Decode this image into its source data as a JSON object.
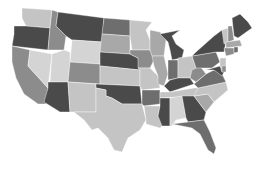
{
  "map": {
    "title": "",
    "shades": {
      "dark": "#4a4a4a",
      "mid_dark": "#6e6e6e",
      "mid": "#8c8c8c",
      "mid_light": "#a8a8a8",
      "light": "#c4c4c4",
      "lightest": "#d4d4d4"
    },
    "states": [
      {
        "id": "WA",
        "shade": "light",
        "points": "22,8 52,10 50,28 26,26 22,18"
      },
      {
        "id": "OR",
        "shade": "dark",
        "points": "14,26 26,26 50,28 48,50 12,46 14,34"
      },
      {
        "id": "CA",
        "shade": "mid",
        "points": "12,46 30,50 28,66 48,88 46,104 38,104 24,94 16,78 12,62"
      },
      {
        "id": "NV",
        "shade": "lightest",
        "points": "30,50 52,54 48,88 28,66"
      },
      {
        "id": "ID",
        "shade": "mid",
        "points": "52,10 58,12 56,26 66,36 64,50 48,50 50,28"
      },
      {
        "id": "MT",
        "shade": "dark",
        "points": "58,12 104,18 102,42 72,40 66,36 56,26"
      },
      {
        "id": "WY",
        "shade": "lightest",
        "points": "72,40 102,42 100,64 70,62"
      },
      {
        "id": "UT",
        "shade": "lightest",
        "points": "52,54 64,50 70,52 70,62 68,82 50,82"
      },
      {
        "id": "AZ",
        "shade": "dark",
        "points": "48,82 68,82 70,112 60,112 44,102 48,88"
      },
      {
        "id": "CO",
        "shade": "mid",
        "points": "70,62 100,64 100,84 68,82"
      },
      {
        "id": "NM",
        "shade": "light",
        "points": "68,82 96,84 96,112 74,112 70,112"
      },
      {
        "id": "ND",
        "shade": "mid_dark",
        "points": "104,18 130,20 130,36 102,34"
      },
      {
        "id": "SD",
        "shade": "mid_light",
        "points": "102,34 130,36 130,54 100,52"
      },
      {
        "id": "NE",
        "shade": "dark",
        "points": "100,52 130,54 138,58 140,70 100,66 100,64"
      },
      {
        "id": "KS",
        "shade": "light",
        "points": "100,66 140,70 140,86 100,84"
      },
      {
        "id": "OK",
        "shade": "dark",
        "points": "96,84 140,86 142,104 122,104 112,98 106,96 106,90 96,88"
      },
      {
        "id": "TX",
        "shade": "light",
        "points": "96,88 106,90 106,96 112,98 122,104 142,104 146,120 140,130 128,138 122,152 114,150 108,138 98,128 92,130 84,120 74,112 96,112"
      },
      {
        "id": "MN",
        "shade": "light",
        "points": "130,20 152,22 146,30 150,40 150,50 132,50 130,36"
      },
      {
        "id": "IA",
        "shade": "mid",
        "points": "130,50 150,50 154,60 150,68 138,68 138,58 130,54"
      },
      {
        "id": "MO",
        "shade": "light",
        "points": "138,68 150,68 158,76 160,88 142,90 140,86 140,70"
      },
      {
        "id": "AR",
        "shade": "mid_dark",
        "points": "142,90 160,90 160,104 144,106 142,104"
      },
      {
        "id": "LA",
        "shade": "light",
        "points": "144,106 160,106 158,116 166,122 160,128 146,124 146,120"
      },
      {
        "id": "WI",
        "shade": "mid_light",
        "points": "150,30 160,32 166,40 164,56 152,56 150,50 150,40"
      },
      {
        "id": "IL",
        "shade": "mid_light",
        "points": "152,56 164,56 168,74 164,86 158,84 158,76 154,66"
      },
      {
        "id": "MI",
        "shade": "dark",
        "points": "160,34 180,30 172,36 176,44 184,50 182,58 172,60 170,50 168,42"
      },
      {
        "id": "IN",
        "shade": "mid_dark",
        "points": "168,60 178,60 178,78 168,80 168,74"
      },
      {
        "id": "OH",
        "shade": "light",
        "points": "178,58 192,56 196,68 190,78 178,78"
      },
      {
        "id": "KY",
        "shade": "dark",
        "points": "164,86 170,80 178,78 190,78 194,84 170,92"
      },
      {
        "id": "TN",
        "shade": "light",
        "points": "160,92 170,92 194,88 206,88 198,96 160,98"
      },
      {
        "id": "MS",
        "shade": "dark",
        "points": "160,98 170,98 170,126 162,126 158,116 160,106"
      },
      {
        "id": "AL",
        "shade": "lightest",
        "points": "170,98 182,96 186,118 176,120 172,126 170,126"
      },
      {
        "id": "GA",
        "shade": "dark",
        "points": "182,96 194,96 206,112 204,120 188,122 186,118"
      },
      {
        "id": "FL",
        "shade": "mid_dark",
        "points": "172,124 188,122 204,120 210,132 216,148 214,154 208,150 200,134 192,128 182,126"
      },
      {
        "id": "SC",
        "shade": "mid_light",
        "points": "194,96 208,94 214,102 206,112"
      },
      {
        "id": "NC",
        "shade": "light",
        "points": "198,88 226,82 228,90 214,102 208,94 194,96"
      },
      {
        "id": "VA",
        "shade": "mid_dark",
        "points": "194,84 206,74 214,70 222,74 226,82 198,88"
      },
      {
        "id": "WV",
        "shade": "mid",
        "points": "192,70 200,66 206,74 196,82 190,78"
      },
      {
        "id": "PA",
        "shade": "mid_dark",
        "points": "192,56 216,52 220,62 212,68 196,68"
      },
      {
        "id": "NY",
        "shade": "dark",
        "points": "196,52 214,36 222,30 226,42 224,52 216,52 192,56"
      },
      {
        "id": "MD",
        "shade": "dark",
        "points": "206,70 220,66 224,72 222,76 214,70"
      },
      {
        "id": "NJ",
        "shade": "light",
        "points": "220,58 226,58 226,70 222,72 220,66"
      },
      {
        "id": "DE",
        "shade": "mid",
        "points": "222,66 226,66 226,72 222,72"
      },
      {
        "id": "VT",
        "shade": "light",
        "points": "222,30 228,28 228,42 224,44"
      },
      {
        "id": "NH",
        "shade": "mid",
        "points": "228,26 232,26 234,40 228,42"
      },
      {
        "id": "ME",
        "shade": "dark",
        "points": "232,18 240,14 248,22 252,28 238,38 234,36"
      },
      {
        "id": "MA",
        "shade": "mid_light",
        "points": "226,42 240,40 242,46 226,48"
      },
      {
        "id": "CT",
        "shade": "mid",
        "points": "224,48 234,48 234,54 226,56"
      },
      {
        "id": "RI",
        "shade": "mid_dark",
        "points": "234,47 238,47 238,52 234,53"
      }
    ]
  }
}
